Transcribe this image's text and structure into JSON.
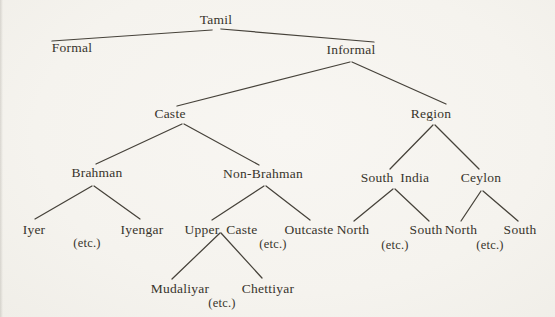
{
  "figure": {
    "background_color": "#f6f4ef",
    "ink_color": "#38342c",
    "line_color": "#46423a",
    "root_label": "Tamil",
    "nodes": [
      {
        "id": "tamil",
        "label": "Tamil",
        "x": 216,
        "y": 13,
        "kind": "label"
      },
      {
        "id": "formal",
        "label": "Formal",
        "x": 72,
        "y": 41,
        "kind": "label"
      },
      {
        "id": "informal",
        "label": "Informal",
        "x": 351,
        "y": 43,
        "kind": "label"
      },
      {
        "id": "caste",
        "label": "Caste",
        "x": 170,
        "y": 107,
        "kind": "label"
      },
      {
        "id": "region",
        "label": "Region",
        "x": 431,
        "y": 107,
        "kind": "label"
      },
      {
        "id": "brahman",
        "label": "Brahman",
        "x": 97,
        "y": 166,
        "kind": "label"
      },
      {
        "id": "non-brahman",
        "label": "Non-Brahman",
        "x": 263,
        "y": 167,
        "kind": "label"
      },
      {
        "id": "south-india",
        "label": "South India",
        "x": 395,
        "y": 171,
        "kind": "label-wide"
      },
      {
        "id": "ceylon",
        "label": "Ceylon",
        "x": 481,
        "y": 171,
        "kind": "label"
      },
      {
        "id": "iyer",
        "label": "Iyer",
        "x": 34,
        "y": 223,
        "kind": "label"
      },
      {
        "id": "etc-brahman",
        "label": "(etc.)",
        "x": 87,
        "y": 236,
        "kind": "etc"
      },
      {
        "id": "iyengar",
        "label": "Iyengar",
        "x": 142,
        "y": 223,
        "kind": "label"
      },
      {
        "id": "upper-caste",
        "label": "Upper Caste",
        "x": 221,
        "y": 223,
        "kind": "label-wide"
      },
      {
        "id": "etc-non-brahman",
        "label": "(etc.)",
        "x": 273,
        "y": 237,
        "kind": "etc"
      },
      {
        "id": "outcaste",
        "label": "Outcaste",
        "x": 309,
        "y": 223,
        "kind": "label"
      },
      {
        "id": "north-south-india",
        "label": "North",
        "x": 353,
        "y": 223,
        "kind": "label"
      },
      {
        "id": "etc-south-india",
        "label": "(etc.)",
        "x": 395,
        "y": 238,
        "kind": "etc"
      },
      {
        "id": "south-south-india",
        "label": "South",
        "x": 426,
        "y": 223,
        "kind": "label"
      },
      {
        "id": "north-ceylon",
        "label": "North",
        "x": 461,
        "y": 223,
        "kind": "label"
      },
      {
        "id": "etc-ceylon",
        "label": "(etc.)",
        "x": 490,
        "y": 238,
        "kind": "etc"
      },
      {
        "id": "south-ceylon",
        "label": "South",
        "x": 520,
        "y": 223,
        "kind": "label"
      },
      {
        "id": "mudaliyar",
        "label": "Mudaliyar",
        "x": 180,
        "y": 282,
        "kind": "label"
      },
      {
        "id": "etc-upper-caste",
        "label": "(etc.)",
        "x": 222,
        "y": 296,
        "kind": "etc"
      },
      {
        "id": "chettiyar",
        "label": "Chettiyar",
        "x": 268,
        "y": 282,
        "kind": "label"
      }
    ],
    "edges": [
      {
        "from": "tamil",
        "to": "formal",
        "x1": 212,
        "y1": 30,
        "x2": 52,
        "y2": 41
      },
      {
        "from": "tamil",
        "to": "informal",
        "x1": 221,
        "y1": 29,
        "x2": 374,
        "y2": 42
      },
      {
        "from": "informal",
        "to": "caste",
        "x1": 350,
        "y1": 62,
        "x2": 177,
        "y2": 106
      },
      {
        "from": "informal",
        "to": "region",
        "x1": 352,
        "y1": 62,
        "x2": 446,
        "y2": 104
      },
      {
        "from": "caste",
        "to": "brahman",
        "x1": 182,
        "y1": 124,
        "x2": 96,
        "y2": 164
      },
      {
        "from": "caste",
        "to": "non-brahman",
        "x1": 184,
        "y1": 124,
        "x2": 259,
        "y2": 165
      },
      {
        "from": "region",
        "to": "south-india",
        "x1": 433,
        "y1": 125,
        "x2": 390,
        "y2": 169
      },
      {
        "from": "region",
        "to": "ceylon",
        "x1": 435,
        "y1": 125,
        "x2": 479,
        "y2": 169
      },
      {
        "from": "brahman",
        "to": "iyer",
        "x1": 92,
        "y1": 186,
        "x2": 35,
        "y2": 219
      },
      {
        "from": "brahman",
        "to": "iyengar",
        "x1": 94,
        "y1": 186,
        "x2": 140,
        "y2": 219
      },
      {
        "from": "non-brahman",
        "to": "upper-caste",
        "x1": 264,
        "y1": 186,
        "x2": 212,
        "y2": 220
      },
      {
        "from": "non-brahman",
        "to": "outcaste",
        "x1": 266,
        "y1": 186,
        "x2": 310,
        "y2": 220
      },
      {
        "from": "upper-caste",
        "to": "mudaliyar",
        "x1": 220,
        "y1": 233,
        "x2": 172,
        "y2": 279
      },
      {
        "from": "upper-caste",
        "to": "chettiyar",
        "x1": 221,
        "y1": 233,
        "x2": 262,
        "y2": 278
      },
      {
        "from": "south-india",
        "to": "north-south-india",
        "x1": 393,
        "y1": 189,
        "x2": 354,
        "y2": 221
      },
      {
        "from": "south-india",
        "to": "south-south-india",
        "x1": 395,
        "y1": 189,
        "x2": 429,
        "y2": 221
      },
      {
        "from": "ceylon",
        "to": "north-ceylon",
        "x1": 481,
        "y1": 191,
        "x2": 461,
        "y2": 221
      },
      {
        "from": "ceylon",
        "to": "south-ceylon",
        "x1": 483,
        "y1": 191,
        "x2": 518,
        "y2": 221
      }
    ]
  }
}
